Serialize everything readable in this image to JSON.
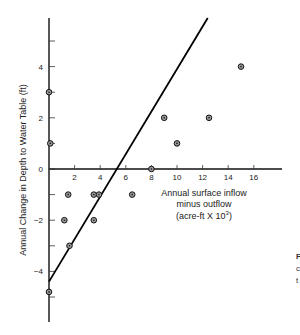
{
  "chart_data": {
    "type": "scatter",
    "title": "",
    "xlabel": [
      "Annual surface inflow",
      "minus outflow",
      "(acre-ft X 10",
      "3",
      ")"
    ],
    "ylabel": "Annual Change in Depth to Water Table (ft)",
    "xlim": [
      0,
      18
    ],
    "ylim": [
      -6,
      6
    ],
    "x_ticks": [
      2,
      4,
      6,
      8,
      10,
      12,
      14,
      16
    ],
    "y_ticks_labeled": [
      4,
      2,
      0,
      -2,
      -4
    ],
    "y_ticks_minor": [
      5,
      3,
      1,
      -1,
      -3,
      -5
    ],
    "grid": false,
    "legend": null,
    "series": [
      {
        "name": "observations",
        "marker": "circle-dot",
        "points": [
          {
            "x": 0,
            "y": 3
          },
          {
            "x": 0.1,
            "y": 1
          },
          {
            "x": 1.5,
            "y": -1
          },
          {
            "x": 1.2,
            "y": -2
          },
          {
            "x": 1.6,
            "y": -3
          },
          {
            "x": 3.5,
            "y": -1
          },
          {
            "x": 3.9,
            "y": -1
          },
          {
            "x": 3.5,
            "y": -2
          },
          {
            "x": 6.5,
            "y": -1
          },
          {
            "x": 8,
            "y": 0
          },
          {
            "x": 9,
            "y": 2
          },
          {
            "x": 10,
            "y": 1
          },
          {
            "x": 12.5,
            "y": 2
          },
          {
            "x": 15,
            "y": 4
          },
          {
            "x": 0,
            "y": -4.8
          }
        ]
      },
      {
        "name": "fit-line",
        "type": "line",
        "points": [
          {
            "x": 0,
            "y": -4.4
          },
          {
            "x": 12.4,
            "y": 5.9
          }
        ]
      }
    ]
  },
  "caption_fragment": [
    "F",
    "c",
    "t"
  ]
}
